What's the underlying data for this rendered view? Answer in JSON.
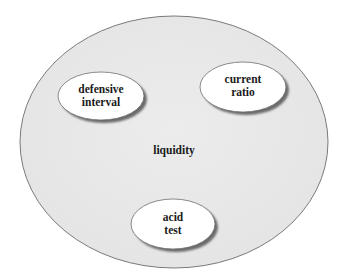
{
  "diagram": {
    "outer": {
      "label": "liquidity",
      "fill": "#e9e9e9",
      "stroke": "#7a7a7a"
    },
    "nodes": [
      {
        "id": "defensive-interval",
        "lines": [
          "defensive",
          "interval"
        ]
      },
      {
        "id": "current-ratio",
        "lines": [
          "current",
          "ratio"
        ]
      },
      {
        "id": "acid-test",
        "lines": [
          "acid",
          "test"
        ]
      }
    ],
    "colors": {
      "node_fill": "#ffffff",
      "node_stroke": "#6e6e6e",
      "shadow": "#6a6a6a",
      "text": "#1a1a1a"
    }
  }
}
